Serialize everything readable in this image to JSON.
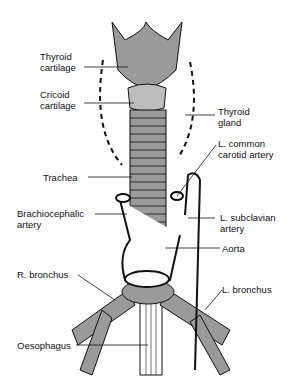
{
  "diagram": {
    "labels": {
      "thyroid_cartilage": [
        "Thyroid",
        "cartilage"
      ],
      "cricoid_cartilage": [
        "Cricoid",
        "cartilage"
      ],
      "thyroid_gland": [
        "Thyroid",
        "gland"
      ],
      "l_common_carotid": [
        "L. common",
        "carotid  artery"
      ],
      "trachea": "Trachea",
      "brachiocephalic": [
        "Brachiocephalic",
        "artery"
      ],
      "l_subclavian": [
        "L. subclavian",
        "artery"
      ],
      "aorta": "Aorta",
      "r_bronchus": "R. bronchus",
      "l_bronchus": "L. bronchus",
      "oesophagus": "Oesophagus"
    },
    "colors": {
      "cartilage": "#9a9a9a",
      "line": "#111111",
      "bg": "#ffffff"
    }
  }
}
